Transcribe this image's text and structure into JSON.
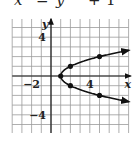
{
  "header": {
    "equation_parts": [
      "x",
      "=",
      "y",
      "2",
      "+",
      "1"
    ],
    "equation_note": "top edge clipped; equation reconstructed from plotted curve"
  },
  "chart_data": {
    "type": "line",
    "xlabel": "x",
    "ylabel": "y",
    "xlim": [
      -4,
      8
    ],
    "ylim": [
      -6,
      6
    ],
    "grid": true,
    "x_tick_labels": [
      {
        "value": -2,
        "label": "−2"
      },
      {
        "value": 4,
        "label": "4"
      }
    ],
    "y_tick_labels": [
      {
        "value": 4,
        "label": "4"
      },
      {
        "value": -4,
        "label": "−4"
      }
    ],
    "series": [
      {
        "name": "x = y^2 + 1 (upper branch)",
        "x": [
          1,
          2,
          5,
          8
        ],
        "y": [
          0,
          1,
          2,
          2.65
        ],
        "marked_points": [
          [
            1,
            0
          ],
          [
            2,
            1
          ],
          [
            5,
            2
          ]
        ],
        "arrow_end": true
      },
      {
        "name": "x = y^2 + 1 (lower branch)",
        "x": [
          1,
          2,
          5,
          8
        ],
        "y": [
          0,
          -1,
          -2,
          -2.65
        ],
        "marked_points": [
          [
            2,
            -1
          ],
          [
            5,
            -2
          ]
        ],
        "arrow_end": true
      }
    ],
    "colors": {
      "grid": "#9a9a9a",
      "axis": "#1a1a1a",
      "curve": "#111111"
    }
  }
}
